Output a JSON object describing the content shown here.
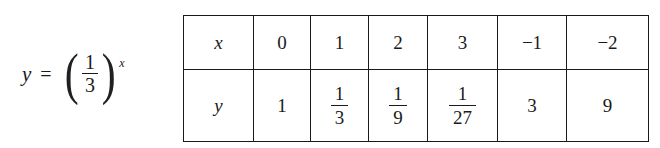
{
  "equation": {
    "lhs": "y",
    "relation": "=",
    "paren_left": "(",
    "paren_right": ")",
    "base_numerator": "1",
    "base_denominator": "3",
    "exponent": "x",
    "plain": "y = (1/3)^x"
  },
  "table": {
    "row_labels": [
      "x",
      "y"
    ],
    "x_values": [
      "0",
      "1",
      "2",
      "3",
      "−1",
      "−2"
    ],
    "y_values": [
      {
        "kind": "integer",
        "text": "1"
      },
      {
        "kind": "fraction",
        "numerator": "1",
        "denominator": "3"
      },
      {
        "kind": "fraction",
        "numerator": "1",
        "denominator": "9"
      },
      {
        "kind": "fraction",
        "numerator": "1",
        "denominator": "27"
      },
      {
        "kind": "integer",
        "text": "3"
      },
      {
        "kind": "integer",
        "text": "9"
      }
    ]
  },
  "chart_data": {
    "type": "table",
    "xlabel": "x",
    "ylabel": "y",
    "categories": [
      "0",
      "1",
      "2",
      "3",
      "-1",
      "-2"
    ],
    "series": [
      {
        "name": "y",
        "values": [
          1,
          0.3333333333333333,
          0.1111111111111111,
          0.037037037037037,
          3,
          9
        ],
        "display": [
          "1",
          "1/3",
          "1/9",
          "1/27",
          "3",
          "9"
        ]
      }
    ],
    "grid": true,
    "legend": "none"
  },
  "colors": {
    "background": "#ffffff",
    "ink": "#1a1a1a",
    "rule": "#1a1a1a"
  }
}
